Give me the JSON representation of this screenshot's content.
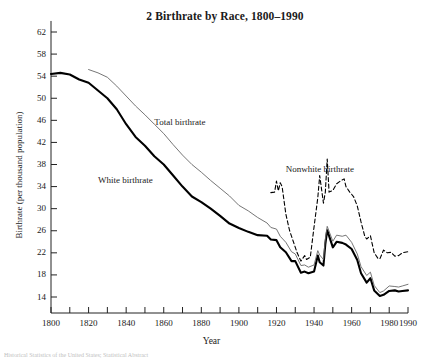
{
  "figure": {
    "title": "2  Birthrate by Race, 1800–1990",
    "source_note": "Historical Statistics of the United States; Statistical Abstract"
  },
  "chart_data": {
    "type": "line",
    "title": "2  Birthrate by Race, 1800–1990",
    "xlabel": "Year",
    "ylabel": "Birthrate (per thousand population)",
    "xlim": [
      1800,
      1990
    ],
    "ylim": [
      12,
      64
    ],
    "grid": false,
    "legend_position": "inline-annotations",
    "yticks": [
      14,
      18,
      22,
      26,
      30,
      34,
      38,
      42,
      46,
      50,
      54,
      58,
      62
    ],
    "ytick_labels": [
      "14",
      "18",
      "22",
      "26",
      "30",
      "34",
      "38",
      "42",
      "46",
      "50",
      "54",
      "58",
      "62"
    ],
    "xticks": [
      1800,
      1810,
      1820,
      1830,
      1840,
      1850,
      1860,
      1870,
      1880,
      1890,
      1900,
      1910,
      1920,
      1930,
      1940,
      1950,
      1960,
      1970,
      1980,
      1990
    ],
    "xtick_labels": [
      "1800",
      "1820",
      "1840",
      "1860",
      "1880",
      "1900",
      "1920",
      "1940",
      "1960",
      "1980",
      "1990"
    ],
    "xtick_labeled_values": [
      1800,
      1820,
      1840,
      1860,
      1880,
      1900,
      1920,
      1940,
      1960,
      1980,
      1990
    ],
    "annotations": [
      {
        "text": "Total birthrate",
        "x": 1855,
        "y": 45.5
      },
      {
        "text": "White birthrate",
        "x": 1825,
        "y": 35.0
      },
      {
        "text": "Nonwhite birthrate",
        "x": 1925,
        "y": 37.0
      }
    ],
    "series": [
      {
        "name": "White birthrate",
        "style": "solid-thick",
        "color": "#000000",
        "width": 2.1,
        "x": [
          1800,
          1805,
          1810,
          1815,
          1820,
          1825,
          1830,
          1835,
          1840,
          1845,
          1850,
          1855,
          1860,
          1865,
          1870,
          1875,
          1880,
          1885,
          1890,
          1895,
          1900,
          1905,
          1910,
          1915,
          1917,
          1920,
          1922,
          1925,
          1928,
          1930,
          1933,
          1935,
          1937,
          1940,
          1942,
          1943,
          1945,
          1946,
          1947,
          1950,
          1952,
          1955,
          1957,
          1960,
          1963,
          1965,
          1968,
          1970,
          1972,
          1975,
          1977,
          1980,
          1983,
          1985,
          1987,
          1990
        ],
        "y": [
          54.4,
          54.6,
          54.3,
          53.4,
          52.8,
          51.4,
          50.0,
          48.0,
          45.3,
          43.0,
          41.4,
          39.5,
          38.0,
          36.0,
          34.0,
          32.2,
          31.2,
          30.0,
          28.7,
          27.3,
          26.5,
          25.8,
          25.2,
          25.1,
          24.4,
          24.3,
          23.0,
          22.1,
          20.5,
          20.5,
          18.4,
          18.6,
          18.3,
          18.6,
          21.5,
          20.3,
          19.7,
          23.6,
          26.1,
          23.0,
          24.0,
          23.8,
          23.5,
          22.7,
          20.7,
          18.3,
          16.6,
          17.4,
          15.2,
          14.2,
          14.4,
          15.1,
          15.2,
          15.0,
          15.1,
          15.2
        ]
      },
      {
        "name": "Total birthrate",
        "style": "solid-thin",
        "color": "#666666",
        "width": 0.9,
        "x": [
          1820,
          1825,
          1830,
          1835,
          1840,
          1845,
          1850,
          1855,
          1860,
          1865,
          1870,
          1875,
          1880,
          1885,
          1890,
          1895,
          1900,
          1905,
          1910,
          1915,
          1917,
          1920,
          1922,
          1925,
          1928,
          1930,
          1933,
          1935,
          1937,
          1940,
          1942,
          1943,
          1945,
          1946,
          1947,
          1950,
          1952,
          1955,
          1957,
          1960,
          1963,
          1965,
          1968,
          1970,
          1972,
          1975,
          1977,
          1980,
          1983,
          1985,
          1987,
          1990
        ],
        "y": [
          55.2,
          54.6,
          53.8,
          52.2,
          50.4,
          48.6,
          47.0,
          45.3,
          43.6,
          41.6,
          39.7,
          38.0,
          36.6,
          35.1,
          33.7,
          32.3,
          30.6,
          29.6,
          28.4,
          27.4,
          26.6,
          26.3,
          25.0,
          23.9,
          22.2,
          21.8,
          19.7,
          19.8,
          19.4,
          19.8,
          22.4,
          21.6,
          20.8,
          24.5,
          26.8,
          24.1,
          25.2,
          25.0,
          25.2,
          23.9,
          21.8,
          19.5,
          17.9,
          18.5,
          16.1,
          14.8,
          15.1,
          16.0,
          15.9,
          15.8,
          16.0,
          16.3
        ]
      },
      {
        "name": "Nonwhite birthrate",
        "style": "dashed",
        "color": "#000000",
        "width": 1.1,
        "x": [
          1917,
          1919,
          1920,
          1921,
          1922,
          1923,
          1925,
          1927,
          1929,
          1931,
          1933,
          1935,
          1936,
          1938,
          1940,
          1942,
          1943,
          1945,
          1946,
          1947,
          1948,
          1950,
          1952,
          1954,
          1956,
          1957,
          1959,
          1961,
          1963,
          1965,
          1967,
          1968,
          1970,
          1972,
          1974,
          1975,
          1977,
          1979,
          1981,
          1983,
          1985,
          1987,
          1990
        ],
        "y": [
          32.9,
          33.0,
          35.0,
          33.2,
          34.7,
          34.0,
          29.0,
          26.0,
          24.0,
          22.0,
          20.5,
          21.5,
          20.8,
          21.2,
          26.7,
          32.0,
          36.0,
          31.0,
          33.0,
          39.0,
          33.0,
          33.3,
          34.5,
          35.0,
          35.4,
          34.0,
          33.0,
          32.2,
          30.5,
          27.6,
          25.0,
          24.5,
          25.1,
          22.0,
          21.0,
          20.9,
          22.5,
          22.0,
          22.1,
          21.4,
          21.5,
          22.0,
          22.2
        ]
      }
    ]
  }
}
